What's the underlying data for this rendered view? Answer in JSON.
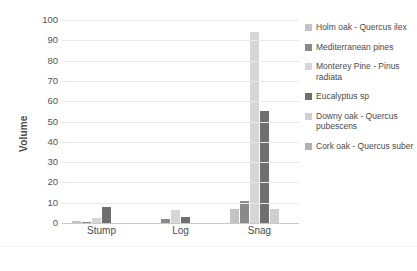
{
  "chart_data": {
    "type": "bar",
    "title": "",
    "xlabel": "",
    "ylabel": "Volume",
    "categories": [
      "Stump",
      "Log",
      "Snag"
    ],
    "ylim": [
      0,
      100
    ],
    "ytick_step": 10,
    "yticks": [
      "100",
      "90",
      "80",
      "70",
      "60",
      "50",
      "40",
      "30",
      "20",
      "10",
      "0"
    ],
    "grid": "horizontal",
    "legend_position": "right",
    "series": [
      {
        "name": "Holm oak - Quercus ilex",
        "color": "#c3c3c3",
        "values": [
          1,
          0,
          7
        ]
      },
      {
        "name": "Mediterranean pines",
        "color": "#8a8a8a",
        "values": [
          0.5,
          2,
          11
        ]
      },
      {
        "name": "Monterey Pine - Pinus radiata",
        "color": "#d6d6d6",
        "values": [
          2.5,
          6.5,
          94
        ]
      },
      {
        "name": "Eucalyptus sp",
        "color": "#6f6f6f",
        "values": [
          8,
          3,
          55
        ]
      },
      {
        "name": "Downy oak - Quercus pubescens",
        "color": "#cfcfcf",
        "values": [
          0,
          0,
          7
        ]
      },
      {
        "name": "Cork oak - Quercus suber",
        "color": "#b0b0b0",
        "values": [
          0,
          0,
          0
        ]
      }
    ]
  },
  "legend": {
    "items": [
      {
        "label": "Holm oak - Quercus ilex"
      },
      {
        "label": "Mediterranean pines"
      },
      {
        "label": "Monterey Pine - Pinus radiata"
      },
      {
        "label": "Eucalyptus sp"
      },
      {
        "label": "Downy oak - Quercus pubescens"
      },
      {
        "label": "Cork oak - Quercus suber"
      }
    ]
  },
  "caption": {
    "text": ""
  }
}
